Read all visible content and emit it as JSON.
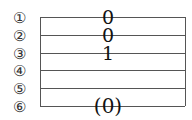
{
  "tab": {
    "strings": [
      {
        "label": "①",
        "y": 17
      },
      {
        "label": "②",
        "y": 35
      },
      {
        "label": "③",
        "y": 53
      },
      {
        "label": "④",
        "y": 70
      },
      {
        "label": "⑤",
        "y": 88
      },
      {
        "label": "⑥",
        "y": 106
      }
    ],
    "notes": [
      {
        "string": 1,
        "fret": "0"
      },
      {
        "string": 2,
        "fret": "0"
      },
      {
        "string": 3,
        "fret": "1"
      },
      {
        "string": 6,
        "fret": "(0)"
      }
    ]
  }
}
